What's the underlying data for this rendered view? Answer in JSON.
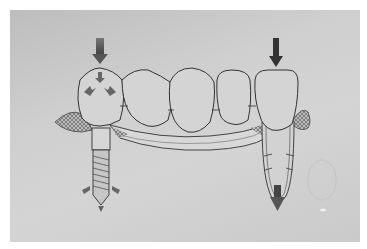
{
  "figure": {
    "elements": {
      "implant_crown": "implant-supported crown with occlusal force arrows",
      "pontics": [
        "pontic-1",
        "pontic-2",
        "pontic-3"
      ],
      "natural_tooth": "natural abutment tooth with periodontal ligament",
      "implant_fixture": "threaded implant fixture",
      "force_arrows": [
        "load-arrow-implant",
        "load-arrow-tooth",
        "stress-arrows-implant-apex",
        "intrusion-arrow-tooth-apex"
      ]
    },
    "colors": {
      "background": "#cfcfcf",
      "line": "#3a3a3a",
      "arrow": "#555555"
    }
  }
}
